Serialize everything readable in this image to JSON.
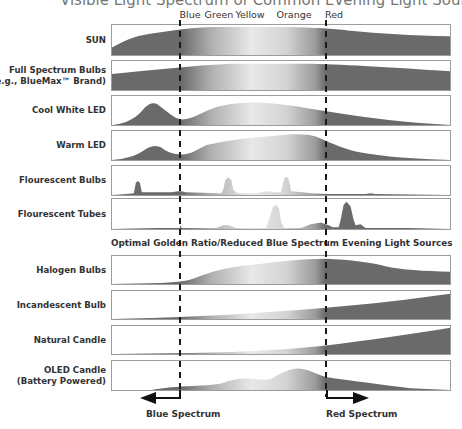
{
  "title": "Visible Light Spectrum of Common Evening Light Sources",
  "color_axis": {
    "labels": [
      {
        "name": "Blue",
        "x": 190
      },
      {
        "name": "Green",
        "x": 219
      },
      {
        "name": "Yellow",
        "x": 250
      },
      {
        "name": "Orange",
        "x": 294
      },
      {
        "name": "Red",
        "x": 334
      }
    ],
    "blue_marker_x": 180,
    "red_marker_x": 326
  },
  "section_caption": "Optimal Golden Ratio/Reduced Blue Spectrum Evening Light Sources",
  "rows": [
    {
      "id": "sun",
      "label": "SUN",
      "label2": "",
      "top": 24,
      "height": 32,
      "path": "M0,32 L0,24 C10,18 20,12 40,9 C60,6 75,3 100,2 L180,2 C210,3 225,4 240,6 C270,9 300,11 340,12 L340,32 Z"
    },
    {
      "id": "full-spectrum",
      "label": "Full Spectrum Bulbs",
      "label2": "(e.g., BlueMax™ Brand)",
      "top": 60,
      "height": 31,
      "path": "M0,31 L0,14 C40,10 80,5 120,3 L200,3 C240,4 280,7 340,11 L340,31 Z"
    },
    {
      "id": "cool-white-led",
      "label": "Cool White LED",
      "label2": "",
      "top": 95,
      "height": 31,
      "path": "M0,31 C10,30 22,26 30,16 C36,8 41,6 46,9 C55,16 62,24 70,25 C78,25 85,21 95,16 C110,9 125,7 145,7 C175,8 200,14 225,18 C260,24 300,29 340,31 Z"
    },
    {
      "id": "warm-led",
      "label": "Warm LED",
      "label2": "",
      "top": 130,
      "height": 31,
      "path": "M0,31 C12,30 24,27 33,20 C40,15 45,15 50,18 C56,23 62,25 70,25 C80,25 85,20 95,15 C120,9 140,7 165,5 C185,3 195,3 205,6 C218,12 228,17 245,22 C275,28 305,30 340,31 Z"
    },
    {
      "id": "fluorescent-bulbs",
      "label": "Flourescent Bulbs",
      "label2": "",
      "top": 165,
      "height": 31,
      "path": "M0,31 L15,30 L22,29 L24,18 L26,16 L28,18 L30,28 L60,28 L66,27 L70,27 L74,28 L110,29 L112,25 L114,15 L117,12 L120,15 L122,25 L126,29 L145,29 L155,27 L165,28 L170,28 L172,18 L174,12 L177,12 L179,20 L180,27 L192,28 L200,29 L215,30 L230,30 L240,30 L255,30 L260,29 L265,30 L340,31 Z"
    },
    {
      "id": "fluorescent-tubes",
      "label": "Flourescent Tubes",
      "label2": "",
      "top": 198,
      "height": 32,
      "path": "M0,32 L45,31 L55,31 L68,31 L69,28 L70,31 L105,31 L112,28 L118,28 L125,31 L155,31 L158,22 L162,8 L165,6 L168,10 L170,24 L173,31 L190,31 L200,27 L210,25 L218,28 L222,30 L228,30 L230,22 L233,6 L236,3 L240,8 L243,22 L245,28 L250,27 L255,31 L290,31 L300,31 L340,32 Z"
    },
    {
      "id": "halogen-bulbs",
      "label": "Halogen Bulbs",
      "label2": "",
      "top": 255,
      "height": 30,
      "path": "M0,30 L50,29 C70,28 80,26 90,21 C105,15 120,11 145,9 C170,6 190,3 215,3 C240,4 260,7 275,11 C290,15 315,16 340,17 L340,30 Z"
    },
    {
      "id": "incandescent-bulb",
      "label": "Incandescent Bulb",
      "label2": "",
      "top": 290,
      "height": 30,
      "path": "M0,30 L40,29 C100,27 160,23 215,18 C260,14 300,9 340,3 L340,30 Z"
    },
    {
      "id": "natural-candle",
      "label": "Natural Candle",
      "label2": "",
      "top": 325,
      "height": 30,
      "path": "M0,30 L80,29 C140,28 180,25 215,21 C260,15 300,9 340,2 L340,30 Z"
    },
    {
      "id": "oled-candle",
      "label": "OLED Candle",
      "label2": "(Battery Powered)",
      "top": 360,
      "height": 31,
      "path": "M40,31 C50,29 60,28 75,27 C90,26 100,26 110,24 C120,20 130,18 140,19 C150,20 155,21 160,19 C170,13 180,7 188,8 C198,9 205,14 215,17 C240,21 270,25 300,29 L340,31 Z"
    }
  ],
  "bottom": {
    "blue_label": "Blue Spectrum",
    "red_label": "Red Spectrum"
  },
  "colors": {
    "dark_fill": "#6a6a6a",
    "light_fill": "#e8e8e8",
    "border": "#9c9c9c",
    "dash": "#1a1a1a"
  }
}
